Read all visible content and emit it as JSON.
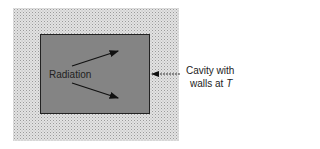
{
  "diagram": {
    "inner_label": "Radiation",
    "callout_line1": "Cavity with",
    "callout_line2": "walls at ",
    "callout_var": "T"
  }
}
